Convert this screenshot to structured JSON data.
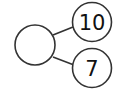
{
  "diagram": {
    "type": "number-bond",
    "whole": {
      "label": ""
    },
    "parts": [
      {
        "label": "10"
      },
      {
        "label": "7"
      }
    ],
    "stroke_color": "#333333",
    "background": "#ffffff"
  }
}
